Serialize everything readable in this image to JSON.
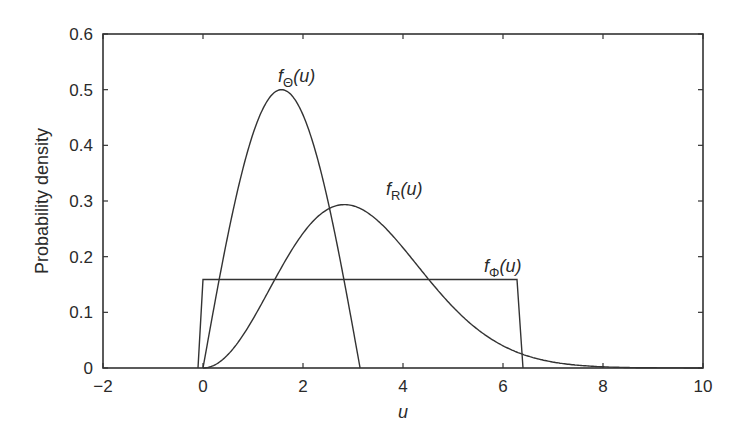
{
  "chart_data": {
    "type": "line",
    "title": "",
    "xlabel": "u",
    "ylabel": "Probability density",
    "xlim": [
      -2,
      10
    ],
    "ylim": [
      0,
      0.6
    ],
    "xticks": [
      -2,
      0,
      2,
      4,
      6,
      8,
      10
    ],
    "yticks": [
      0,
      0.1,
      0.2,
      0.3,
      0.4,
      0.5,
      0.6
    ],
    "xtick_labels": [
      "−2",
      "0",
      "2",
      "4",
      "6",
      "8",
      "10"
    ],
    "ytick_labels": [
      "0",
      "0.1",
      "0.2",
      "0.3",
      "0.4",
      "0.5",
      "0.6"
    ],
    "grid": false,
    "legend": "none (inline curve labels)",
    "series": [
      {
        "name": "f_Θ(u)",
        "label_main": "f",
        "label_sub": "Θ",
        "label_arg": "(u)",
        "description": "0.5 sin(u) on [0, π]",
        "x": [
          0,
          0.25,
          0.5,
          0.75,
          1.0,
          1.25,
          1.5,
          1.57,
          1.75,
          2.0,
          2.25,
          2.5,
          2.75,
          3.0,
          3.14
        ],
        "values": [
          0,
          0.124,
          0.24,
          0.341,
          0.421,
          0.474,
          0.499,
          0.5,
          0.492,
          0.455,
          0.389,
          0.299,
          0.191,
          0.071,
          0
        ]
      },
      {
        "name": "f_R(u)",
        "label_main": "f",
        "label_sub": "R",
        "label_arg": "(u)",
        "description": "Maxwell density, sigma = 2, peak ~0.29 at u ~2.83",
        "x": [
          0,
          0.5,
          1,
          1.5,
          2,
          2.5,
          2.83,
          3,
          3.5,
          4,
          4.5,
          5,
          5.5,
          6,
          6.5,
          7,
          7.5,
          8
        ],
        "values": [
          0,
          0.024,
          0.088,
          0.169,
          0.242,
          0.285,
          0.293,
          0.292,
          0.262,
          0.216,
          0.161,
          0.109,
          0.068,
          0.04,
          0.021,
          0.01,
          0.005,
          0.002
        ]
      },
      {
        "name": "f_Φ(u)",
        "label_main": "f",
        "label_sub": "Φ",
        "label_arg": "(u)",
        "description": "Uniform on [0, 2π], height 1/(2π)",
        "x": [
          -0.1,
          0,
          6.28,
          6.4
        ],
        "values": [
          0,
          0.159,
          0.159,
          0
        ]
      }
    ]
  }
}
